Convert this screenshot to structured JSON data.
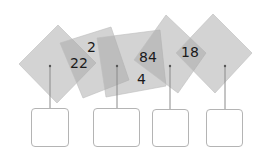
{
  "diagram": {
    "shapes": [
      {
        "id": "shape-1",
        "label": ""
      },
      {
        "id": "shape-2",
        "labels": [
          "2",
          "22"
        ]
      },
      {
        "id": "shape-3",
        "labels": [
          "84",
          "4"
        ]
      },
      {
        "id": "shape-4",
        "labels": [
          "18"
        ]
      },
      {
        "id": "shape-5",
        "label": ""
      }
    ],
    "answer_boxes": [
      {
        "id": "box-1",
        "value": ""
      },
      {
        "id": "box-2",
        "value": ""
      },
      {
        "id": "box-3",
        "value": ""
      },
      {
        "id": "box-4",
        "value": ""
      }
    ],
    "colors": {
      "shape_fill": "#a8a8a8",
      "stroke": "#999999",
      "box_border": "#b4b4b4"
    }
  }
}
